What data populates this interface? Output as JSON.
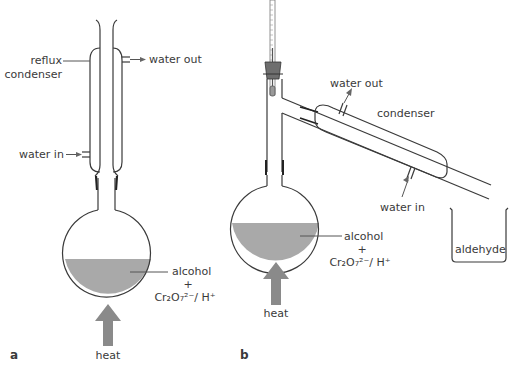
{
  "figure": {
    "panels": [
      {
        "id": "a",
        "label": "a",
        "title": "Heating under reflux",
        "labels": {
          "condenser": [
            "reflux",
            "condenser"
          ],
          "water_out": "water out",
          "water_in": "water in",
          "mixture_line1": "alcohol",
          "mixture_plus": "+",
          "mixture_reagent": "Cr₂O₇²⁻/ H⁺",
          "heat": "heat"
        }
      },
      {
        "id": "b",
        "label": "b",
        "title": "Distillation",
        "labels": {
          "water_out": "water out",
          "condenser": "condenser",
          "water_in": "water in",
          "mixture_line1": "alcohol",
          "mixture_plus": "+",
          "mixture_reagent": "Cr₂O₇²⁻/ H⁺",
          "heat": "heat",
          "receiver": "aldehyde"
        }
      }
    ],
    "colors": {
      "liquid": "#a9a9a9",
      "heat_arrow": "#8a8a8a",
      "outline": "#3a3a3a",
      "stopper": "#6e6e6e"
    }
  }
}
